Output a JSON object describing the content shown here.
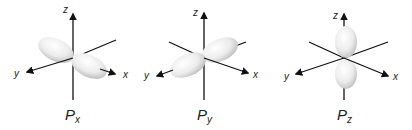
{
  "orbitals": [
    {
      "name": "P",
      "subscript": "x",
      "orientation": "x",
      "axes": {
        "x": "x",
        "y": "y",
        "z": "z"
      }
    },
    {
      "name": "P",
      "subscript": "y",
      "orientation": "y",
      "axes": {
        "x": "x",
        "y": "y",
        "z": "z"
      }
    },
    {
      "name": "P",
      "subscript": "z",
      "orientation": "z",
      "axes": {
        "x": "x",
        "y": "y",
        "z": "z"
      }
    }
  ],
  "colors": {
    "axis": "#111111",
    "lobe_light": "#ffffff",
    "lobe_shade": "#c8c8c8",
    "label": "#222222"
  }
}
